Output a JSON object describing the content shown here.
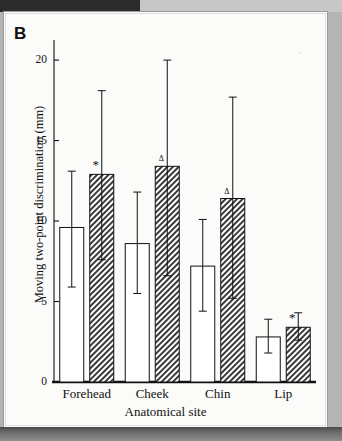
{
  "panel": {
    "letter": "B"
  },
  "chart_data": {
    "type": "bar",
    "title": "",
    "xlabel": "Anatomical site",
    "ylabel": "Moving two-point discrimination (mm)",
    "categories": [
      "Forehead",
      "Cheek",
      "Chin",
      "Lip"
    ],
    "ytick_labels": [
      "0",
      "5",
      "10",
      "15",
      "20"
    ],
    "yticks": [
      0,
      5,
      10,
      15,
      20
    ],
    "ylim": [
      0,
      21
    ],
    "grid": false,
    "legend": null,
    "series": [
      {
        "name": "Open bar",
        "fill": "open",
        "values": [
          9.6,
          8.6,
          7.2,
          2.8
        ],
        "err_upper": [
          13.1,
          11.8,
          10.1,
          3.9
        ],
        "err_lower": [
          5.9,
          5.5,
          4.4,
          1.8
        ],
        "markers": [
          "",
          "",
          "",
          ""
        ]
      },
      {
        "name": "Hatched bar",
        "fill": "hatched",
        "values": [
          12.9,
          13.4,
          11.4,
          3.4
        ],
        "err_upper": [
          18.1,
          20.0,
          17.7,
          4.3
        ],
        "err_lower": [
          7.6,
          6.6,
          5.2,
          2.6
        ],
        "markers": [
          "*",
          "Δ",
          "Δ",
          "*"
        ]
      }
    ],
    "annotations": [
      {
        "text": "*",
        "category": "Forehead",
        "series": "Hatched bar"
      },
      {
        "text": "Δ",
        "category": "Cheek",
        "series": "Hatched bar"
      },
      {
        "text": "Δ",
        "category": "Chin",
        "series": "Hatched bar"
      },
      {
        "text": "*",
        "category": "Lip",
        "series": "Hatched bar"
      }
    ]
  },
  "colors": {
    "ink": "#111111",
    "page": "#fbfbf9",
    "margin": "#b4b4b4",
    "hatch": "#3a3a3a"
  }
}
